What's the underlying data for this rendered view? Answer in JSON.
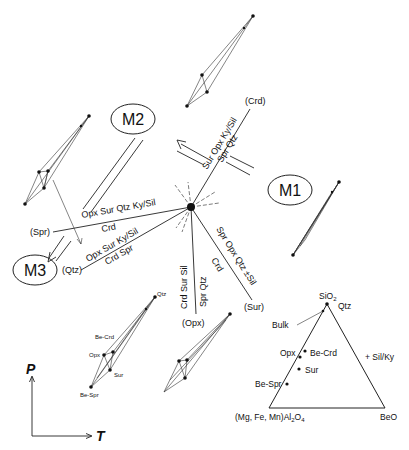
{
  "phases": {
    "m1": "M1",
    "m2": "M2",
    "m3": "M3"
  },
  "reactions": {
    "crd_line": {
      "absent": "(Crd)",
      "left_side": "Sur Opx Ky/Sil",
      "right_side": "Spr Qtz"
    },
    "spr_line": {
      "absent": "(Spr)",
      "upper_side": "Opx Sur Qtz Ky/Sil",
      "lower_side": "Crd"
    },
    "qtz_line": {
      "absent": "(Qtz)",
      "upper_side": "Opx Sur Ky/Sil",
      "lower_side": "Crd Spr"
    },
    "opx_line": {
      "absent": "(Opx)",
      "left_side": "Crd Sur Sil",
      "right_side": "Spr Qtz"
    },
    "sur_line": {
      "absent": "(Sur)",
      "upper_side": "Spr Opx Qtz ±Sil",
      "lower_side": "Crd"
    }
  },
  "axes": {
    "y": "P",
    "x": "T"
  },
  "small_ternary_labels": {
    "qtz": "Qtz",
    "be_crd": "Be-Crd",
    "opx": "Opx",
    "sur": "Sur",
    "be_spr": "Be-Spr"
  },
  "ternary": {
    "apex_top": "SiO",
    "apex_top_sub": "2",
    "apex_left": "(Mg, Fe, Mn)Al",
    "apex_left_sub1": "2",
    "apex_left_mid": "O",
    "apex_left_sub2": "4",
    "apex_right": "BeO",
    "excess": "+ Sil/Ky",
    "points": {
      "qtz": "Qtz",
      "bulk": "Bulk",
      "opx": "Opx",
      "be_crd": "Be-Crd",
      "sur": "Sur",
      "be_spr": "Be-Spr"
    }
  }
}
